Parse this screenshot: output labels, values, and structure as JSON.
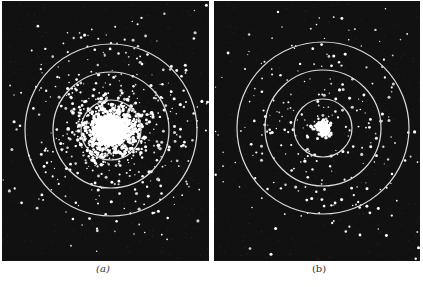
{
  "figure": {
    "background": "#ffffff",
    "panels": [
      {
        "id": "a",
        "caption": "(a)",
        "bg_color": "#111111",
        "center": [
          109,
          129
        ],
        "ring_radii": [
          30,
          58,
          86
        ],
        "ring_color": "#dddddd",
        "core_radius": 26,
        "core_description": "large dense bright central cluster",
        "scatter_density": "high"
      },
      {
        "id": "b",
        "caption": "(b)",
        "bg_color": "#111111",
        "center": [
          109,
          127
        ],
        "ring_radii": [
          29,
          58,
          86
        ],
        "ring_color": "#dddddd",
        "core_radius": 8,
        "core_description": "small bright central spot",
        "scatter_density": "medium"
      }
    ]
  }
}
